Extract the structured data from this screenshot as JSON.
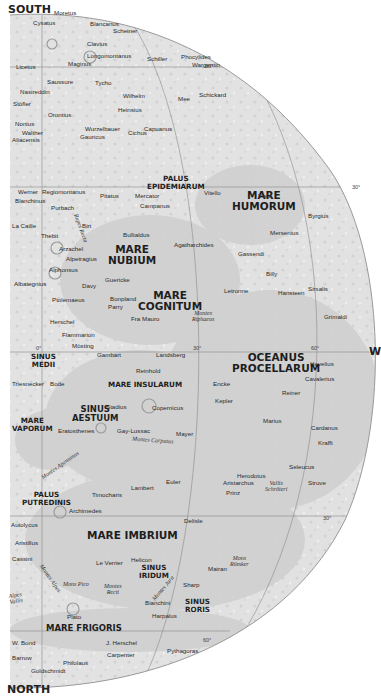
{
  "map": {
    "title": "Moon near side, southwest quadrant",
    "colors": {
      "terrain_light": "#e3e3e3",
      "maria": "#cfcfcf",
      "graticule": "#8a8a8a",
      "background": "#ffffff",
      "label": "#2a2a2a"
    },
    "directions": {
      "top": "SOUTH",
      "bottom": "NORTH",
      "right": "W"
    },
    "graticule_labels": {
      "lat_60_south": "60°",
      "lat_30_south": "30°",
      "lon_0": "0°",
      "lon_30": "30°",
      "lon_60": "60°",
      "lat_30_north": "30°",
      "lat_60_north": "60°"
    },
    "maria": [
      {
        "id": "mare_humorum",
        "line1": "MARE",
        "line2": "HUMORUM"
      },
      {
        "id": "mare_nubium",
        "line1": "MARE",
        "line2": "NUBIUM"
      },
      {
        "id": "mare_cognitum",
        "line1": "MARE",
        "line2": "COGNITUM"
      },
      {
        "id": "palus_epidemiarum",
        "line1": "PALUS",
        "line2": "EPIDEMIARUM"
      },
      {
        "id": "sinus_medii",
        "line1": "SINUS",
        "line2": "MEDII"
      },
      {
        "id": "oceanus_procellarum",
        "line1": "OCEANUS",
        "line2": "PROCELLARUM"
      },
      {
        "id": "mare_insularum",
        "line1": "MARE INSULARUM",
        "line2": ""
      },
      {
        "id": "sinus_aestuum",
        "line1": "SINUS",
        "line2": "AESTUUM"
      },
      {
        "id": "mare_vaporum",
        "line1": "MARE",
        "line2": "VAPORUM"
      },
      {
        "id": "palus_putredinis",
        "line1": "PALUS",
        "line2": "PUTREDINIS"
      },
      {
        "id": "mare_imbrium",
        "line1": "MARE IMBRIUM",
        "line2": ""
      },
      {
        "id": "sinus_iridum",
        "line1": "SINUS",
        "line2": "IRIDUM"
      },
      {
        "id": "sinus_roris",
        "line1": "SINUS",
        "line2": "RORIS"
      },
      {
        "id": "mare_frigoris",
        "line1": "MARE FRIGORIS",
        "line2": ""
      }
    ],
    "features": [
      {
        "id": "rupes_recta",
        "text": "Rupes Recta"
      },
      {
        "id": "montes_riphaeus",
        "line1": "Montes",
        "line2": "Riphaeus"
      },
      {
        "id": "montes_carpatus",
        "text": "Montes Carpatus"
      },
      {
        "id": "montes_apenninus",
        "text": "Montes Apenninus"
      },
      {
        "id": "vallis_schroteri",
        "line1": "Vallis",
        "line2": "Schröteri"
      },
      {
        "id": "mons_romker",
        "line1": "Mons",
        "line2": "Rümker"
      },
      {
        "id": "montes_alpes",
        "text": "Montes Alpes"
      },
      {
        "id": "mons_pico",
        "text": "Mons Pico"
      },
      {
        "id": "montes_recti",
        "line1": "Montes",
        "line2": "Recti"
      },
      {
        "id": "vallis_alpes",
        "line1": "Alpes",
        "line2": "Vallis"
      },
      {
        "id": "montes_jura",
        "text": "Montes Jura"
      }
    ],
    "craters": [
      "Moretus",
      "Cysatus",
      "Blancanus",
      "Scheiner",
      "Clavius",
      "Longomontanus",
      "Schiller",
      "Phocylides",
      "Wargentin",
      "Licetus",
      "Maginus",
      "Saussure",
      "Tycho",
      "Nasireddin",
      "Wilhelm",
      "Mee",
      "Schickard",
      "Stöfler",
      "Heinsius",
      "Orontius",
      "Nonius",
      "Wurzelbauer",
      "Capuanus",
      "Walther",
      "Gauricus",
      "Cichus",
      "Aliacensis",
      "Werner",
      "Regiomontanus",
      "Pitatus",
      "Mercator",
      "Vitello",
      "Vieta",
      "Byrgius",
      "Blanchinus",
      "Purbach",
      "Campanus",
      "Mersenius",
      "La Caille",
      "Thebit",
      "Birt",
      "Bullialdus",
      "Agatharchides",
      "Gassendi",
      "Arzachel",
      "Alpetragius",
      "Alphonsus",
      "Billy",
      "Sirsalis",
      "Albategnius",
      "Davy",
      "Guericke",
      "Letronne",
      "Hansteen",
      "Ptolemaeus",
      "Bonpland",
      "Parry",
      "Fra Mauro",
      "Grimaldi",
      "Herschel",
      "Flammarion",
      "Mösting",
      "Gambart",
      "Landsberg",
      "Hevelius",
      "Reinhold",
      "Cavalerius",
      "Triesnecker",
      "Bode",
      "Encke",
      "Reiner",
      "Kepler",
      "Stadius",
      "Copernicus",
      "Cardanus",
      "Eratosthenes",
      "Gay-Lussac",
      "Mayer",
      "Marius",
      "Krafft",
      "Seleucus",
      "Herodotus",
      "Struve",
      "Aristarchus",
      "Prinz",
      "Euler",
      "Lambert",
      "Timocharis",
      "Archimedes",
      "Delisle",
      "Autolycus",
      "Aristillus",
      "Cassini",
      "Le Verrier",
      "Helicon",
      "Mairan",
      "Sharp",
      "Bianchini",
      "Harpalus",
      "Plato",
      "W. Bond",
      "J. Herschel",
      "Pythagoras",
      "Barrow",
      "Carpenter",
      "Philolaus",
      "Goldschmidt"
    ]
  }
}
